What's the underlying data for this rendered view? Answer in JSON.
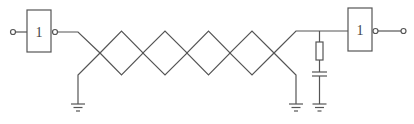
{
  "diagram": {
    "type": "circuit-schematic",
    "left_gate": {
      "label": "1",
      "kind": "inverter"
    },
    "right_gate": {
      "label": "1",
      "kind": "inverter"
    },
    "twisted_pair": {
      "twists": 5
    },
    "termination": {
      "components": [
        "resistor",
        "capacitor"
      ],
      "to": "ground"
    },
    "grounds": 3,
    "colors": {
      "line": "#555555",
      "background": "#ffffff"
    }
  }
}
